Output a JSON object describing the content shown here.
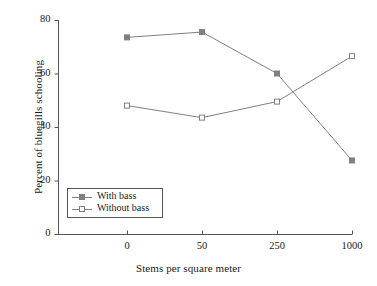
{
  "chart_data": {
    "type": "line",
    "title": "",
    "xlabel": "Stems per square meter",
    "ylabel": "Percent of bluegills schooling",
    "categories": [
      "0",
      "50",
      "250",
      "1000"
    ],
    "series": [
      {
        "name": "With bass",
        "marker": "filled-square",
        "values": [
          73.5,
          75.5,
          60.0,
          27.5
        ]
      },
      {
        "name": "Without bass",
        "marker": "open-square",
        "values": [
          48.0,
          43.5,
          49.5,
          66.5
        ]
      }
    ],
    "ylim": [
      0,
      80
    ],
    "yticks": [
      "0",
      "20",
      "40",
      "60",
      "80"
    ],
    "ytick_values": [
      0,
      20,
      40,
      60,
      80
    ],
    "grid": false,
    "legend_position": "lower-left-inside",
    "colors": {
      "line": "#808080",
      "marker_fill": "#808080",
      "marker_open_fill": "#ffffff",
      "marker_edge": "#808080",
      "axis": "#555555",
      "text": "#1a1a1a",
      "background": "#ffffff"
    }
  },
  "legend": {
    "entries": [
      {
        "label": "With bass"
      },
      {
        "label": "Without bass"
      }
    ]
  }
}
